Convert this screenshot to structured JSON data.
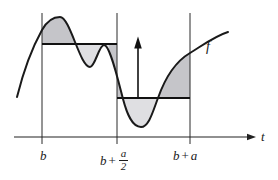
{
  "figure": {
    "function_label": "f",
    "axis": {
      "label": "t"
    },
    "ticks": {
      "b": "b",
      "mid": {
        "base": "b",
        "plus": "+",
        "numerator": "a",
        "denominator": "2"
      },
      "right": {
        "base": "b",
        "plus": "+",
        "addend": "a"
      }
    },
    "colors": {
      "shade_dark": "#c5c5c9",
      "shade_light": "#dfdfe2",
      "ink": "#1a1a1a"
    }
  }
}
